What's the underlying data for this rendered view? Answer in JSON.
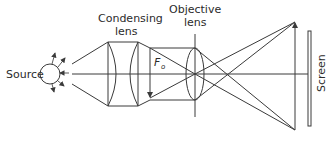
{
  "diagram": {
    "labels": {
      "source": "Source",
      "condensing_line1": "Condensing",
      "condensing_line2": "lens",
      "objective_line1": "Objective",
      "objective_line2": "lens",
      "object_symbol": "F",
      "object_subscript": "o",
      "screen": "Screen"
    },
    "components": [
      {
        "id": "source",
        "type": "light-source",
        "label": "Source"
      },
      {
        "id": "condensing-lens",
        "type": "lens-pair",
        "label": "Condensing lens"
      },
      {
        "id": "object",
        "type": "object-arrow",
        "label": "Fo",
        "orientation": "inverted"
      },
      {
        "id": "objective-lens",
        "type": "convex-lens",
        "label": "Objective lens"
      },
      {
        "id": "image",
        "type": "image-arrow",
        "orientation": "upright"
      },
      {
        "id": "screen",
        "type": "screen",
        "label": "Screen"
      }
    ],
    "colors": {
      "line": "#3a3a3a",
      "text": "#2b2b2b",
      "background": "#ffffff"
    }
  }
}
